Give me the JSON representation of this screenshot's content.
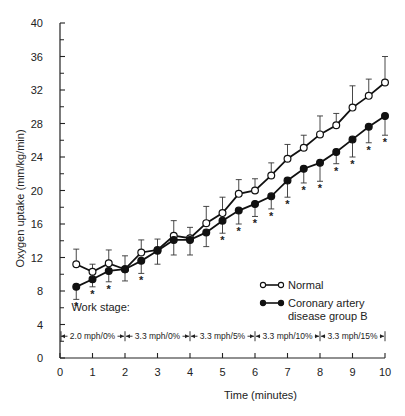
{
  "chart_data": {
    "type": "line",
    "title": "",
    "xlabel": "Time (minutes)",
    "ylabel": "Oxygen uptake (mm/kg/min)",
    "xlim": [
      0,
      10
    ],
    "ylim": [
      0,
      40
    ],
    "x_ticks": [
      0,
      1,
      2,
      3,
      4,
      5,
      6,
      7,
      8,
      9,
      10
    ],
    "y_ticks": [
      0,
      4,
      8,
      12,
      16,
      20,
      24,
      28,
      32,
      36,
      40
    ],
    "grid": false,
    "legend_position": "bottom-right",
    "x": [
      0.5,
      1,
      1.5,
      2,
      2.5,
      3,
      3.5,
      4,
      4.5,
      5,
      5.5,
      6,
      6.5,
      7,
      7.5,
      8,
      8.5,
      9,
      9.5,
      10
    ],
    "series": [
      {
        "name": "Normal",
        "marker": "open-circle",
        "error_direction": "up",
        "values": [
          11.2,
          10.3,
          11.3,
          10.6,
          12.6,
          12.9,
          14.6,
          14.3,
          16.1,
          17.3,
          19.6,
          20.0,
          21.8,
          23.8,
          25.1,
          26.7,
          27.8,
          29.9,
          31.3,
          32.9
        ],
        "errors": [
          1.8,
          0.9,
          1.6,
          1.6,
          1.5,
          1.3,
          1.8,
          1.3,
          2.0,
          1.9,
          1.7,
          1.4,
          1.5,
          1.7,
          1.5,
          2.2,
          1.4,
          2.6,
          2.0,
          3.1
        ]
      },
      {
        "name": "Coronary artery disease group B",
        "marker": "filled-circle",
        "error_direction": "down",
        "values": [
          8.5,
          9.4,
          10.4,
          10.6,
          11.6,
          12.8,
          14.1,
          14.1,
          15.0,
          16.4,
          17.6,
          18.4,
          19.3,
          21.2,
          22.6,
          23.3,
          24.6,
          26.1,
          27.6,
          28.9
        ],
        "errors": [
          1.5,
          0.9,
          1.3,
          1.4,
          1.5,
          1.6,
          1.8,
          1.8,
          1.7,
          1.5,
          1.6,
          1.5,
          1.5,
          2.0,
          1.7,
          2.2,
          1.4,
          2.1,
          1.9,
          2.3
        ]
      }
    ],
    "significance_marker": "*",
    "significant_x": [
      0.5,
      1,
      1.5,
      2.5,
      5,
      5.5,
      6,
      6.5,
      7,
      7.5,
      8,
      8.5,
      9,
      9.5,
      10
    ],
    "work_stage_title": "Work stage:",
    "work_stages": [
      {
        "from": 0,
        "to": 2,
        "label": "2.0 mph/0%"
      },
      {
        "from": 2,
        "to": 4,
        "label": "3.3 mph/0%"
      },
      {
        "from": 4,
        "to": 6,
        "label": "3.3 mph/5%"
      },
      {
        "from": 6,
        "to": 8,
        "label": "3.3 mph/10%"
      },
      {
        "from": 8,
        "to": 10,
        "label": "3.3 mph/15%"
      }
    ],
    "legend": [
      {
        "label_lines": [
          "Normal"
        ],
        "marker": "open-circle"
      },
      {
        "label_lines": [
          "Coronary artery",
          "disease group B"
        ],
        "marker": "filled-circle"
      }
    ]
  }
}
